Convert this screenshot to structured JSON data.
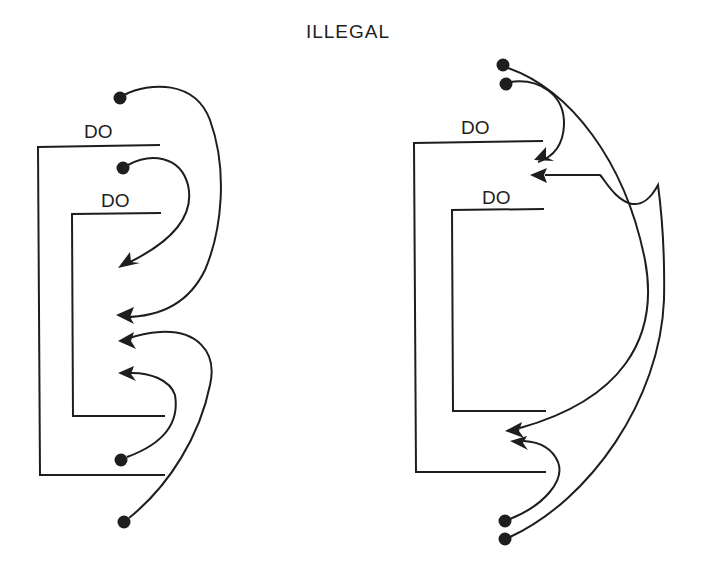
{
  "title": "ILLEGAL",
  "colors": {
    "ink": "#1e1e1e",
    "background": "#ffffff"
  },
  "left_diagram": {
    "outer_loop_label": "DO",
    "inner_loop_label": "DO",
    "transfers": [
      {
        "from": "before outer DO",
        "to": "inside outer loop, after inner loop end",
        "kind": "jump-in"
      },
      {
        "from": "between outer and inner DO",
        "to": "inside inner loop",
        "kind": "jump-in"
      },
      {
        "from": "after outer loop end",
        "to": "inside outer loop, after inner loop end",
        "kind": "jump-in"
      },
      {
        "from": "after inner loop end (inside outer)",
        "to": "inside inner loop",
        "kind": "jump-in"
      }
    ]
  },
  "right_diagram": {
    "outer_loop_label": "DO",
    "inner_loop_label": "DO",
    "transfers": [
      {
        "from": "before outer DO",
        "to": "inside outer loop, before inner DO",
        "kind": "jump-in"
      },
      {
        "from": "before outer DO",
        "to": "inside outer loop, after inner loop end",
        "kind": "jump-in"
      },
      {
        "from": "after outer loop end",
        "to": "inside outer loop, before inner DO",
        "kind": "jump-in"
      },
      {
        "from": "after outer loop end",
        "to": "inside outer loop, after inner loop end",
        "kind": "jump-in"
      }
    ]
  }
}
